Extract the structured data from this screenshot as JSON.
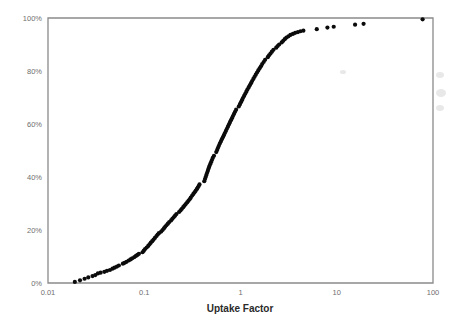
{
  "chart_data": {
    "type": "scatter",
    "title": "",
    "xlabel": "Uptake Factor",
    "ylabel": "",
    "xscale": "log",
    "yscale": "linear",
    "xlim": [
      0.01,
      100
    ],
    "ylim": [
      0,
      100
    ],
    "grid": false,
    "legend": null,
    "xticks": [
      0.01,
      0.1,
      1,
      10,
      100
    ],
    "xtick_labels": [
      "0.01",
      "0.1",
      "1",
      "10",
      "100"
    ],
    "yticks": [
      0,
      20,
      40,
      60,
      80,
      100
    ],
    "ytick_labels": [
      "0%",
      "20%",
      "40%",
      "60%",
      "80%",
      "100%"
    ],
    "series": [
      {
        "name": "Cumulative distribution",
        "marker": "circle",
        "color": "#0b0b0b",
        "points": [
          [
            0.019,
            0.4
          ],
          [
            0.0215,
            1.0
          ],
          [
            0.024,
            1.6
          ],
          [
            0.0262,
            2.1
          ],
          [
            0.029,
            2.6
          ],
          [
            0.031,
            3.0
          ],
          [
            0.033,
            3.6
          ],
          [
            0.0352,
            3.9
          ],
          [
            0.0385,
            4.2
          ],
          [
            0.041,
            4.6
          ],
          [
            0.044,
            4.9
          ],
          [
            0.0468,
            5.4
          ],
          [
            0.0492,
            5.8
          ],
          [
            0.052,
            6.2
          ],
          [
            0.0545,
            6.6
          ],
          [
            0.06,
            7.3
          ],
          [
            0.0625,
            7.6
          ],
          [
            0.0655,
            8.0
          ],
          [
            0.069,
            8.5
          ],
          [
            0.072,
            8.9
          ],
          [
            0.075,
            9.3
          ],
          [
            0.079,
            9.8
          ],
          [
            0.082,
            10.2
          ],
          [
            0.085,
            10.6
          ],
          [
            0.088,
            11.0
          ],
          [
            0.096,
            11.6
          ],
          [
            0.099,
            12.2
          ],
          [
            0.102,
            12.8
          ],
          [
            0.106,
            13.4
          ],
          [
            0.11,
            14.0
          ],
          [
            0.1135,
            14.6
          ],
          [
            0.117,
            15.2
          ],
          [
            0.121,
            15.8
          ],
          [
            0.125,
            16.4
          ],
          [
            0.129,
            17.0
          ],
          [
            0.134,
            17.7
          ],
          [
            0.138,
            18.3
          ],
          [
            0.142,
            18.8
          ],
          [
            0.15,
            19.4
          ],
          [
            0.155,
            20.0
          ],
          [
            0.16,
            20.6
          ],
          [
            0.165,
            21.2
          ],
          [
            0.17,
            21.8
          ],
          [
            0.176,
            22.4
          ],
          [
            0.182,
            23.0
          ],
          [
            0.19,
            23.6
          ],
          [
            0.196,
            24.2
          ],
          [
            0.202,
            24.8
          ],
          [
            0.209,
            25.4
          ],
          [
            0.216,
            26.0
          ],
          [
            0.23,
            26.8
          ],
          [
            0.238,
            27.4
          ],
          [
            0.246,
            28.0
          ],
          [
            0.254,
            28.6
          ],
          [
            0.262,
            29.2
          ],
          [
            0.27,
            29.8
          ],
          [
            0.279,
            30.4
          ],
          [
            0.288,
            31.0
          ],
          [
            0.296,
            31.6
          ],
          [
            0.304,
            32.2
          ],
          [
            0.315,
            33.0
          ],
          [
            0.324,
            33.6
          ],
          [
            0.333,
            34.2
          ],
          [
            0.342,
            34.8
          ],
          [
            0.351,
            35.4
          ],
          [
            0.36,
            36.0
          ],
          [
            0.368,
            36.6
          ],
          [
            0.375,
            37.2
          ],
          [
            0.42,
            38.4
          ],
          [
            0.428,
            39.2
          ],
          [
            0.435,
            40.0
          ],
          [
            0.442,
            40.8
          ],
          [
            0.45,
            41.6
          ],
          [
            0.458,
            42.4
          ],
          [
            0.466,
            43.2
          ],
          [
            0.474,
            44.0
          ],
          [
            0.484,
            44.8
          ],
          [
            0.494,
            45.6
          ],
          [
            0.505,
            46.4
          ],
          [
            0.515,
            47.2
          ],
          [
            0.53,
            48.0
          ],
          [
            0.56,
            49.4
          ],
          [
            0.572,
            50.2
          ],
          [
            0.584,
            51.0
          ],
          [
            0.596,
            51.8
          ],
          [
            0.61,
            52.6
          ],
          [
            0.625,
            53.4
          ],
          [
            0.64,
            54.2
          ],
          [
            0.656,
            55.0
          ],
          [
            0.672,
            55.8
          ],
          [
            0.688,
            56.6
          ],
          [
            0.705,
            57.4
          ],
          [
            0.722,
            58.2
          ],
          [
            0.74,
            59.0
          ],
          [
            0.758,
            59.8
          ],
          [
            0.776,
            60.6
          ],
          [
            0.795,
            61.4
          ],
          [
            0.815,
            62.2
          ],
          [
            0.835,
            63.0
          ],
          [
            0.856,
            63.8
          ],
          [
            0.878,
            64.6
          ],
          [
            0.9,
            65.4
          ],
          [
            0.96,
            66.6
          ],
          [
            0.985,
            67.4
          ],
          [
            1.01,
            68.2
          ],
          [
            1.035,
            69.0
          ],
          [
            1.06,
            69.8
          ],
          [
            1.09,
            70.6
          ],
          [
            1.12,
            71.4
          ],
          [
            1.15,
            72.2
          ],
          [
            1.18,
            73.0
          ],
          [
            1.215,
            73.8
          ],
          [
            1.25,
            74.6
          ],
          [
            1.285,
            75.4
          ],
          [
            1.32,
            76.2
          ],
          [
            1.36,
            77.0
          ],
          [
            1.4,
            77.8
          ],
          [
            1.44,
            78.6
          ],
          [
            1.485,
            79.4
          ],
          [
            1.53,
            80.2
          ],
          [
            1.58,
            81.0
          ],
          [
            1.63,
            81.8
          ],
          [
            1.68,
            82.6
          ],
          [
            1.74,
            83.4
          ],
          [
            1.8,
            84.2
          ],
          [
            1.92,
            85.2
          ],
          [
            1.98,
            85.9
          ],
          [
            2.05,
            86.6
          ],
          [
            2.12,
            87.3
          ],
          [
            2.2,
            88.0
          ],
          [
            2.35,
            88.8
          ],
          [
            2.43,
            89.4
          ],
          [
            2.52,
            90.0
          ],
          [
            2.68,
            90.8
          ],
          [
            2.78,
            91.4
          ],
          [
            2.88,
            92.0
          ],
          [
            3.0,
            92.6
          ],
          [
            3.15,
            93.1
          ],
          [
            3.3,
            93.6
          ],
          [
            3.5,
            94.0
          ],
          [
            3.7,
            94.4
          ],
          [
            3.95,
            94.7
          ],
          [
            4.2,
            95.0
          ],
          [
            4.5,
            95.2
          ],
          [
            6.2,
            95.8
          ],
          [
            8.0,
            96.4
          ],
          [
            9.3,
            96.7
          ],
          [
            15.5,
            97.5
          ],
          [
            19.0,
            97.8
          ],
          [
            78.0,
            99.5
          ]
        ]
      }
    ],
    "axes_px": {
      "left": 48,
      "right": 433,
      "top": 18,
      "bottom": 283
    }
  },
  "figure": {
    "background_color": "#ffffff",
    "frame_color": "#8a8a8a",
    "marker_color": "#0b0b0b",
    "tick_label_color": "#6f6f6f",
    "axis_title_color": "#2a2a2a",
    "marker_radius_px": 2.1
  }
}
